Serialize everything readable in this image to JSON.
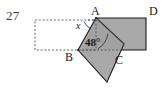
{
  "figure": {
    "problem_number": "27",
    "type": "geometry-diagram",
    "colors": {
      "shape_fill": "#a8a8a8",
      "shape_stroke": "#1a1a1a",
      "dashed_stroke": "#555555",
      "background": "#ffffff",
      "text": "#1a1a1a",
      "number_text": "#3a3a3a"
    },
    "vertex_labels": {
      "a": "A",
      "b": "B",
      "c": "C",
      "d": "D"
    },
    "angle_labels": {
      "unknown": "x",
      "known": "48°"
    },
    "geometry": {
      "dashed_rect": {
        "x": 35,
        "y": 20,
        "width": 61,
        "height": 30
      },
      "point_a": {
        "x": 96,
        "y": 18
      },
      "point_b": {
        "x": 78,
        "y": 50
      },
      "point_c": {
        "x": 124,
        "y": 56
      },
      "point_d": {
        "x": 146,
        "y": 18
      },
      "rect_bottom_y": 50,
      "diamond_bottom": {
        "x": 107,
        "y": 82
      }
    }
  }
}
